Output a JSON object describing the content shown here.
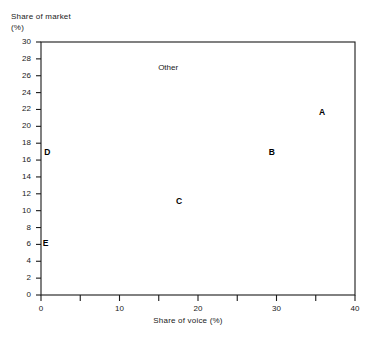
{
  "chart_data": {
    "type": "scatter",
    "title": "",
    "xlabel": "Share of voice (%)",
    "ylabel_line1": "Share of market",
    "ylabel_line2": "(%)",
    "xlim": [
      0,
      40
    ],
    "ylim": [
      0,
      30
    ],
    "xticks": [
      0,
      10,
      20,
      30,
      40
    ],
    "xtick_labels": [
      "0",
      "10",
      "20",
      "30",
      "40"
    ],
    "x_minor_ticks": [
      5,
      15,
      25,
      35
    ],
    "yticks": [
      0,
      2,
      4,
      6,
      8,
      10,
      12,
      14,
      16,
      18,
      20,
      22,
      24,
      26,
      28,
      30
    ],
    "ytick_labels": [
      "0",
      "2",
      "4",
      "6",
      "8",
      "10",
      "12",
      "14",
      "16",
      "18",
      "20",
      "22",
      "24",
      "26",
      "28",
      "30"
    ],
    "grid": false,
    "legend": "none",
    "frame": "box",
    "points": [
      {
        "label": "A",
        "x": 35.8,
        "y": 21.7,
        "bold": true
      },
      {
        "label": "B",
        "x": 29.4,
        "y": 17.0,
        "bold": true
      },
      {
        "label": "C",
        "x": 17.6,
        "y": 11.1,
        "bold": true
      },
      {
        "label": "D",
        "x": 0.8,
        "y": 17.0,
        "bold": true
      },
      {
        "label": "E",
        "x": 0.6,
        "y": 6.2,
        "bold": true
      },
      {
        "label": "Other",
        "x": 16.2,
        "y": 27.0,
        "bold": false
      }
    ]
  }
}
